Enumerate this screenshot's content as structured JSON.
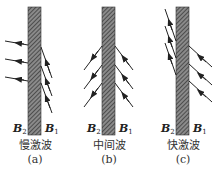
{
  "figure": {
    "panels": [
      {
        "id": "a",
        "name": "慢激波",
        "tag": "(a)",
        "left_label": "B",
        "left_sub": "2",
        "right_label": "B",
        "right_sub": "1"
      },
      {
        "id": "b",
        "name": "中间波",
        "tag": "(b)",
        "left_label": "B",
        "left_sub": "2",
        "right_label": "B",
        "right_sub": "1"
      },
      {
        "id": "c",
        "name": "快激波",
        "tag": "(c)",
        "left_label": "B",
        "left_sub": "2",
        "right_label": "B",
        "right_sub": "1"
      }
    ],
    "colors": {
      "line": "#222222",
      "hatch_bg": "#888888",
      "hatch_line": "#333333"
    }
  }
}
